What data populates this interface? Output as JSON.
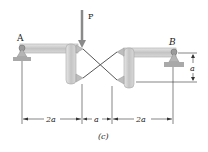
{
  "figure": {
    "caption": "(c)",
    "load_label": "P",
    "support_left_label": "A",
    "support_right_label": "B",
    "dimensions": {
      "span1": "2a",
      "span2": "a",
      "span3": "2a",
      "vertical": "a"
    },
    "colors": {
      "member_fill": "#cfcfcf",
      "member_stroke": "#9a9a9a",
      "line": "#333333",
      "load_arrow": "#888888"
    }
  }
}
